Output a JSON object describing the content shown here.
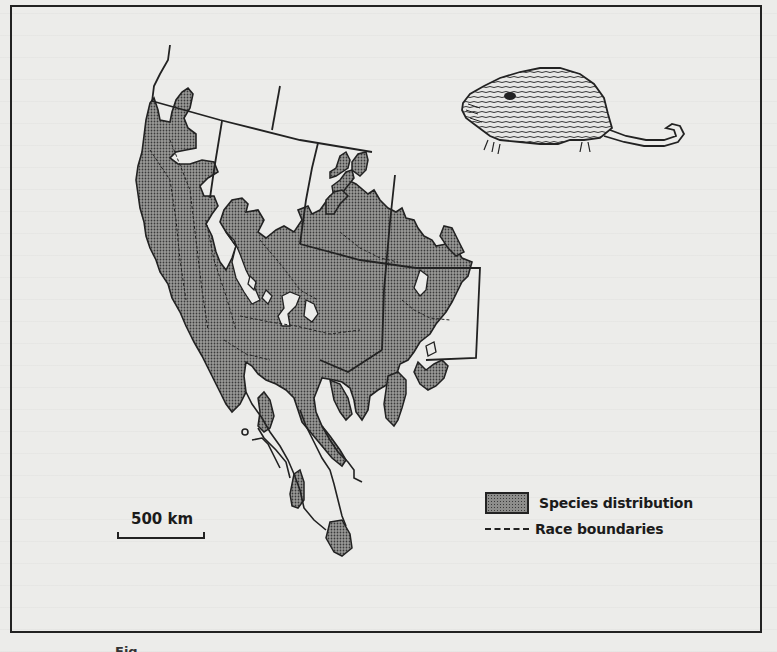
{
  "figure": {
    "type": "species distribution map",
    "region": "North America",
    "illustration": "rodent (pocket gopher) drawing",
    "caption_visible": "Fig."
  },
  "legend": {
    "items": [
      {
        "symbol": "stippled-gray-box",
        "label": "Species distribution"
      },
      {
        "symbol": "dashed-line",
        "label": "Race boundaries"
      }
    ]
  },
  "scale_bar": {
    "label": "500 km"
  },
  "colors": {
    "fill": "#8d8d8b",
    "stipple": "#3a3a3a",
    "ink": "#222222",
    "paper": "#ececea"
  }
}
